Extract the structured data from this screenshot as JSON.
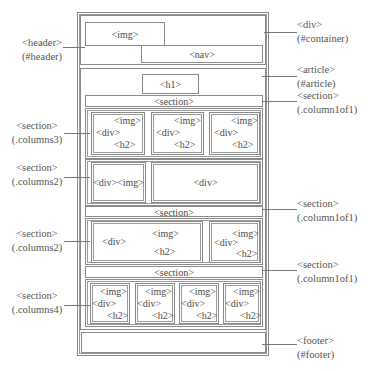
{
  "diagram": {
    "container": {
      "tag": "<div>",
      "id": "(#container)"
    },
    "header": {
      "tag": "<header>",
      "id": "(#header)",
      "img": "<img>",
      "nav": "<nav>"
    },
    "article": {
      "tag": "<article>",
      "id": "(#article)",
      "h1": "<h1>",
      "section1": {
        "tag": "<section>",
        "class": "(.column1of1)",
        "label": "<section>"
      },
      "columns3": {
        "tag": "<section>",
        "class": "(.columns3)",
        "items": [
          {
            "img": "<img>",
            "div": "<div>",
            "h2": "<h2>"
          },
          {
            "img": "<img>",
            "div": "<div>",
            "h2": "<h2>"
          },
          {
            "img": "<img>",
            "div": "<div>",
            "h2": "<h2>"
          }
        ]
      },
      "columns2a": {
        "tag": "<section>",
        "class": "(.columns2)",
        "left": "<div><img>",
        "right": "<div>"
      },
      "section2": {
        "tag": "<section>",
        "class": "(.column1of1)",
        "label": "<section>"
      },
      "columns2b": {
        "tag": "<section>",
        "class": "(.columns2)",
        "left": {
          "div": "<div>",
          "img": "<img>",
          "h2": "<h2>"
        },
        "right": {
          "div": "<div>",
          "img": "<img>",
          "h2": "<h2>"
        }
      },
      "section3": {
        "tag": "<section>",
        "class": "(.column1of1)",
        "label": "<section>"
      },
      "columns4": {
        "tag": "<section>",
        "class": "(.columns4)",
        "items": [
          {
            "img": "<img>",
            "div": "<div>",
            "h2": "<h2>"
          },
          {
            "img": "<img>",
            "div": "<div>",
            "h2": "<h2>"
          },
          {
            "img": "<img>",
            "div": "<div>",
            "h2": "<h2>"
          },
          {
            "img": "<img>",
            "div": "<div>",
            "h2": "<h2>"
          }
        ]
      }
    },
    "footer": {
      "tag": "<footer>",
      "id": "(#footer)"
    }
  }
}
